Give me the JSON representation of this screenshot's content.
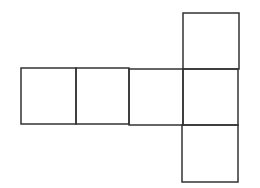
{
  "diagram": {
    "type": "cube-net",
    "stroke_color": "#333333",
    "background": "#ffffff",
    "squares": [
      {
        "id": "row-1",
        "x": 21,
        "y": 68,
        "w": 55,
        "h": 56
      },
      {
        "id": "row-2",
        "x": 76,
        "y": 68,
        "w": 53,
        "h": 56
      },
      {
        "id": "row-3",
        "x": 129,
        "y": 69,
        "w": 54,
        "h": 56
      },
      {
        "id": "row-4",
        "x": 183,
        "y": 69,
        "w": 55,
        "h": 56
      },
      {
        "id": "top",
        "x": 183,
        "y": 13,
        "w": 56,
        "h": 56
      },
      {
        "id": "bottom",
        "x": 182,
        "y": 125,
        "w": 56,
        "h": 57
      }
    ]
  }
}
